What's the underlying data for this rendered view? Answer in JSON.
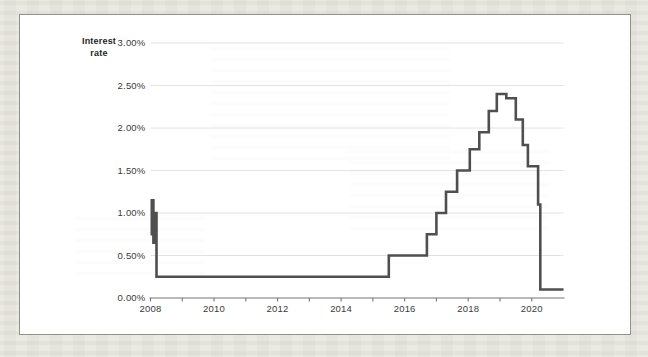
{
  "page": {
    "background_color": "#eae9e2",
    "panel_background": "#ffffff",
    "panel_border_color": "#90908c"
  },
  "chart_data": {
    "type": "line",
    "subtype": "step",
    "title": "Interest rate",
    "title_lines": [
      "Interest",
      "rate"
    ],
    "xlabel": "",
    "ylabel": "Interest rate",
    "xlim": [
      2008,
      2021.0
    ],
    "ylim": [
      0,
      3.0
    ],
    "grid": "horizontal-only",
    "legend": "none",
    "grid_color": "#e2e2e2",
    "axis_color": "#757575",
    "tick_label_color": "#3a3a3a",
    "y_ticks": [
      {
        "value": 0.0,
        "label": "0.00%"
      },
      {
        "value": 0.5,
        "label": "0.50%"
      },
      {
        "value": 1.0,
        "label": "1.00%"
      },
      {
        "value": 1.5,
        "label": "1.50%"
      },
      {
        "value": 2.0,
        "label": "2.00%"
      },
      {
        "value": 2.5,
        "label": "2.50%"
      },
      {
        "value": 3.0,
        "label": "3.00%"
      }
    ],
    "x_minor_tick_years": [
      2008,
      2009,
      2010,
      2011,
      2012,
      2013,
      2014,
      2015,
      2016,
      2017,
      2018,
      2019,
      2020
    ],
    "x_major_ticks": [
      {
        "year": 2008,
        "label": "2008"
      },
      {
        "year": 2010,
        "label": "2010"
      },
      {
        "year": 2012,
        "label": "2012"
      },
      {
        "year": 2014,
        "label": "2014"
      },
      {
        "year": 2016,
        "label": "2016"
      },
      {
        "year": 2018,
        "label": "2018"
      },
      {
        "year": 2020,
        "label": "2020"
      }
    ],
    "series": [
      {
        "name": "Interest rate",
        "color": "#4f4f4f",
        "line_width": 2.6,
        "step_points_year_ratePct": [
          [
            2008.0,
            0.75
          ],
          [
            2008.04,
            1.15
          ],
          [
            2008.09,
            0.65
          ],
          [
            2008.13,
            1.0
          ],
          [
            2008.19,
            0.25
          ],
          [
            2015.5,
            0.5
          ],
          [
            2016.7,
            0.75
          ],
          [
            2017.0,
            1.0
          ],
          [
            2017.3,
            1.25
          ],
          [
            2017.65,
            1.5
          ],
          [
            2018.05,
            1.75
          ],
          [
            2018.35,
            1.95
          ],
          [
            2018.65,
            2.2
          ],
          [
            2018.9,
            2.4
          ],
          [
            2019.2,
            2.35
          ],
          [
            2019.5,
            2.1
          ],
          [
            2019.72,
            1.8
          ],
          [
            2019.88,
            1.55
          ],
          [
            2020.2,
            1.1
          ],
          [
            2020.27,
            0.1
          ]
        ],
        "end_year": 2021.0
      }
    ]
  }
}
